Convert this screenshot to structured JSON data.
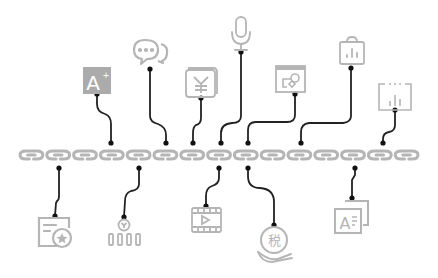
{
  "diagram": {
    "type": "chain-with-icons",
    "colors": {
      "background": "#ffffff",
      "chain": "#b5b5b5",
      "connector": "#222222",
      "icon_stroke": "#b0b0b0",
      "icon_fill_dark": "#a9a9a9"
    },
    "chain": {
      "y": 155,
      "x_start": 18,
      "x_end": 420,
      "links": 15
    },
    "top_icons": [
      {
        "name": "font-size-increase-icon",
        "glyph": "A+",
        "cx": 100,
        "cy": 81
      },
      {
        "name": "chat-bubbles-icon",
        "glyph": "",
        "cx": 150,
        "cy": 52
      },
      {
        "name": "yen-document-icon",
        "glyph": "¥",
        "cx": 201,
        "cy": 82
      },
      {
        "name": "microphone-icon",
        "glyph": "",
        "cx": 241,
        "cy": 33
      },
      {
        "name": "image-window-icon",
        "glyph": "",
        "cx": 290,
        "cy": 79
      },
      {
        "name": "clipboard-chart-icon",
        "glyph": "",
        "cx": 352,
        "cy": 51
      },
      {
        "name": "bar-chart-frame-icon",
        "glyph": "",
        "cx": 395,
        "cy": 96
      }
    ],
    "bottom_icons": [
      {
        "name": "calendar-star-icon",
        "glyph": "",
        "cx": 55,
        "cy": 232
      },
      {
        "name": "coin-bars-icon",
        "glyph": "¥",
        "cx": 124,
        "cy": 232
      },
      {
        "name": "video-play-icon",
        "glyph": "",
        "cx": 207,
        "cy": 220
      },
      {
        "name": "tax-hand-icon",
        "glyph": "税",
        "cx": 274,
        "cy": 244
      },
      {
        "name": "text-document-icon",
        "glyph": "A",
        "cx": 352,
        "cy": 217
      }
    ]
  }
}
